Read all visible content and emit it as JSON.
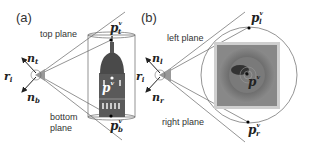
{
  "panels": {
    "a": {
      "label": "(a)",
      "top_plane": "top plane",
      "bottom_plane_line1": "bottom",
      "bottom_plane_line2": "plane",
      "n_top": "n",
      "n_top_sub": "t",
      "r": "r",
      "r_sub": "i",
      "n_bottom": "n",
      "n_bottom_sub": "b",
      "p_top": "p",
      "p_top_sup": "v",
      "p_top_sub": "t",
      "p_center": "p",
      "p_center_sup": "v",
      "p_bottom": "p",
      "p_bottom_sup": "v",
      "p_bottom_sub": "b",
      "object": "tower-image"
    },
    "b": {
      "label": "(b)",
      "left_plane": "left plane",
      "right_plane": "right plane",
      "n_left": "n",
      "n_left_sub": "l",
      "r": "r",
      "r_sub": "i",
      "n_right": "n",
      "n_right_sub": "r",
      "p_left": "p",
      "p_left_sup": "v",
      "p_left_sub": "l",
      "p_center": "p",
      "p_center_sup": "v",
      "p_right": "p",
      "p_right_sup": "v",
      "p_right_sub": "r",
      "object": "top-view-image"
    }
  },
  "colors": {
    "line": "#555555",
    "frustum_apex": "#9a9a9a",
    "text": "#333333"
  }
}
